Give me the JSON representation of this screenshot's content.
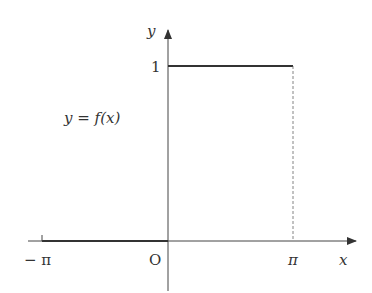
{
  "diagram": {
    "type": "function-graph",
    "function_label": "y = f(x)",
    "axes": {
      "x_label": "x",
      "y_label": "y",
      "origin_label": "O"
    },
    "ticks": {
      "x": [
        {
          "value": "-π",
          "label": "− π"
        },
        {
          "value": "0",
          "label": "O"
        },
        {
          "value": "π",
          "label": "π"
        }
      ],
      "y": [
        {
          "value": "1",
          "label": "1"
        }
      ]
    },
    "pieces": [
      {
        "interval": "[-π, 0)",
        "value": 0
      },
      {
        "interval": "[0, π]",
        "value": 1
      }
    ],
    "colors": {
      "line": "#333333",
      "axis": "#444444",
      "text": "#333333"
    }
  }
}
